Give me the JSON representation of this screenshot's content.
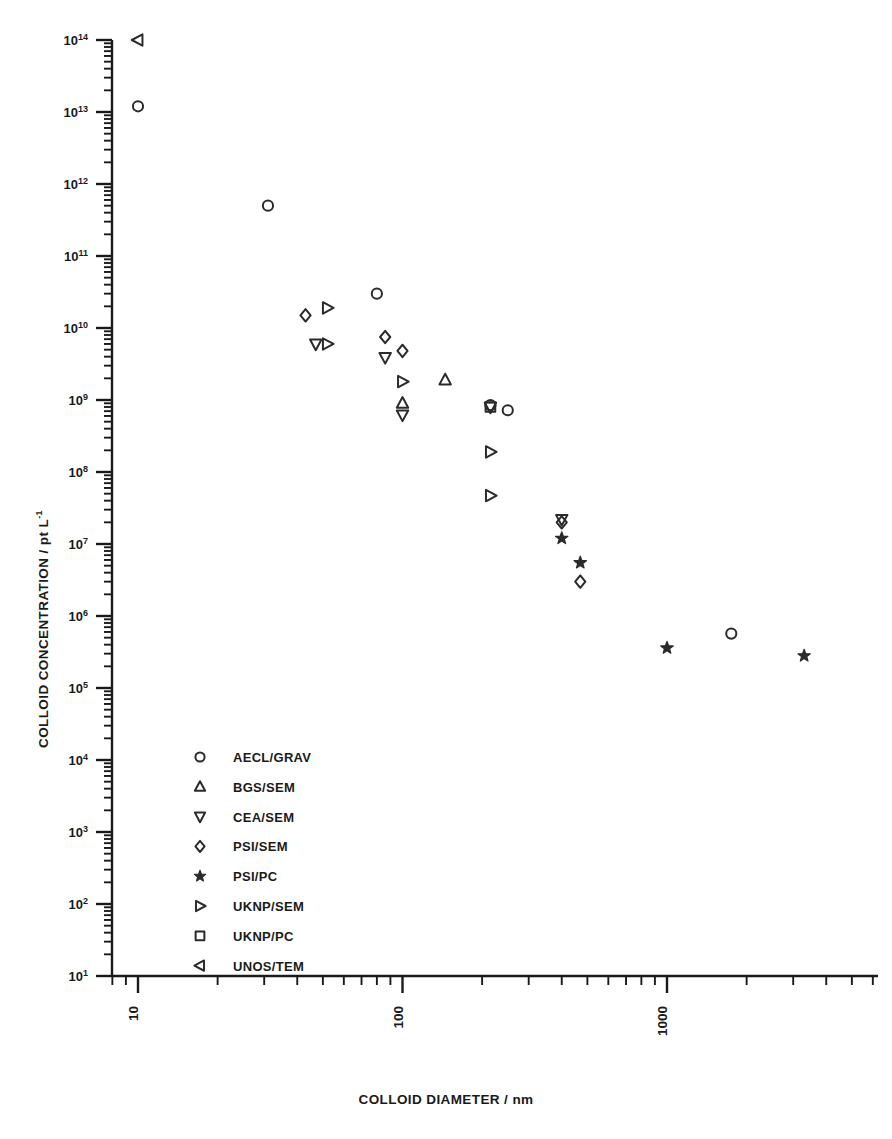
{
  "chart_data": {
    "type": "scatter",
    "title": "",
    "xlabel": "COLLOID DIAMETER / nm",
    "ylabel": "COLLOID CONCENTRATION / pt L",
    "ylabel_sup": "-1",
    "xscale": "log",
    "yscale": "log",
    "xlim": [
      8,
      5000
    ],
    "ylim": [
      10,
      100000000000000
    ],
    "grid": false,
    "legend_position": "lower-left-inside",
    "xticks": [
      {
        "value": 10,
        "label": "10"
      },
      {
        "value": 100,
        "label": "100"
      },
      {
        "value": 1000,
        "label": "1000"
      }
    ],
    "yticks": [
      {
        "value": 100000000000000,
        "mantissa": "10",
        "exp": "14"
      },
      {
        "value": 10000000000000,
        "mantissa": "10",
        "exp": "13"
      },
      {
        "value": 1000000000000,
        "mantissa": "10",
        "exp": "12"
      },
      {
        "value": 100000000000,
        "mantissa": "10",
        "exp": "11"
      },
      {
        "value": 10000000000,
        "mantissa": "10",
        "exp": "10"
      },
      {
        "value": 1000000000,
        "mantissa": "10",
        "exp": "9"
      },
      {
        "value": 100000000,
        "mantissa": "10",
        "exp": "8"
      },
      {
        "value": 10000000,
        "mantissa": "10",
        "exp": "7"
      },
      {
        "value": 1000000,
        "mantissa": "10",
        "exp": "6"
      },
      {
        "value": 100000,
        "mantissa": "10",
        "exp": "5"
      },
      {
        "value": 10000,
        "mantissa": "10",
        "exp": "4"
      },
      {
        "value": 1000,
        "mantissa": "10",
        "exp": "3"
      },
      {
        "value": 100,
        "mantissa": "10",
        "exp": "2"
      },
      {
        "value": 10,
        "mantissa": "10",
        "exp": "1"
      }
    ],
    "series": [
      {
        "name": "AECL/GRAV",
        "marker": "circle",
        "points": [
          {
            "x": 10,
            "y": 12000000000000
          },
          {
            "x": 31,
            "y": 500000000000
          },
          {
            "x": 80,
            "y": 30000000000
          },
          {
            "x": 215,
            "y": 850000000
          },
          {
            "x": 250,
            "y": 720000000
          },
          {
            "x": 1750,
            "y": 570000
          }
        ]
      },
      {
        "name": "BGS/SEM",
        "marker": "triangle-up",
        "points": [
          {
            "x": 100,
            "y": 900000000
          },
          {
            "x": 145,
            "y": 1900000000
          }
        ]
      },
      {
        "name": "CEA/SEM",
        "marker": "triangle-down",
        "points": [
          {
            "x": 47,
            "y": 6000000000
          },
          {
            "x": 86,
            "y": 3900000000
          },
          {
            "x": 100,
            "y": 620000000
          },
          {
            "x": 215,
            "y": 800000000
          },
          {
            "x": 400,
            "y": 22000000
          }
        ]
      },
      {
        "name": "PSI/SEM",
        "marker": "diamond",
        "points": [
          {
            "x": 43,
            "y": 15000000000
          },
          {
            "x": 86,
            "y": 7500000000
          },
          {
            "x": 100,
            "y": 4800000000
          },
          {
            "x": 400,
            "y": 20000000
          },
          {
            "x": 470,
            "y": 3000000
          }
        ]
      },
      {
        "name": "PSI/PC",
        "marker": "star",
        "points": [
          {
            "x": 400,
            "y": 12000000
          },
          {
            "x": 470,
            "y": 5500000
          },
          {
            "x": 1000,
            "y": 360000
          },
          {
            "x": 3300,
            "y": 280000
          }
        ]
      },
      {
        "name": "UKNP/SEM",
        "marker": "triangle-right",
        "points": [
          {
            "x": 52,
            "y": 19000000000
          },
          {
            "x": 52,
            "y": 6000000000
          },
          {
            "x": 100,
            "y": 1800000000
          },
          {
            "x": 215,
            "y": 190000000
          },
          {
            "x": 215,
            "y": 47000000
          }
        ]
      },
      {
        "name": "UKNP/PC",
        "marker": "square",
        "points": [
          {
            "x": 215,
            "y": 800000000
          }
        ]
      },
      {
        "name": "UNOS/TEM",
        "marker": "triangle-left",
        "points": [
          {
            "x": 10,
            "y": 100000000000000
          }
        ]
      }
    ]
  },
  "legend": {
    "items": [
      {
        "label": "AECL/GRAV",
        "marker": "circle"
      },
      {
        "label": "BGS/SEM",
        "marker": "triangle-up"
      },
      {
        "label": "CEA/SEM",
        "marker": "triangle-down"
      },
      {
        "label": "PSI/SEM",
        "marker": "diamond"
      },
      {
        "label": "PSI/PC",
        "marker": "star"
      },
      {
        "label": "UKNP/SEM",
        "marker": "triangle-right"
      },
      {
        "label": "UKNP/PC",
        "marker": "square"
      },
      {
        "label": "UNOS/TEM",
        "marker": "triangle-left"
      }
    ]
  },
  "style": {
    "axis_color": "#1a1a1a",
    "marker_color": "#2b2b2b",
    "background": "#ffffff"
  }
}
